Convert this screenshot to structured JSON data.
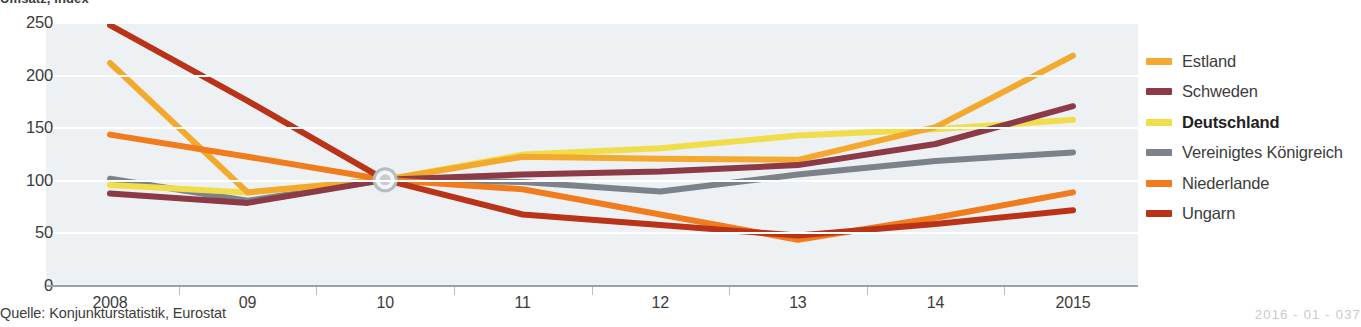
{
  "title": "Umsatz, Index",
  "source_note": "Quelle: Konjunkturstatistik, Eurostat",
  "doc_code": "2016 - 01 - 037",
  "legend": {
    "items": [
      {
        "label": "Estland",
        "color": "#f3a92e",
        "bold": false
      },
      {
        "label": "Schweden",
        "color": "#8c3a46",
        "bold": false
      },
      {
        "label": "Deutschland",
        "color": "#f0dd4a",
        "bold": true
      },
      {
        "label": "Vereinigtes Königreich",
        "color": "#7b8289",
        "bold": false
      },
      {
        "label": "Niederlande",
        "color": "#f07c1e",
        "bold": false
      },
      {
        "label": "Ungarn",
        "color": "#b93318",
        "bold": false
      }
    ]
  },
  "axes": {
    "y_ticks": [
      "0",
      "50",
      "100",
      "150",
      "200",
      "250"
    ],
    "x_ticks": [
      "2008",
      "09",
      "10",
      "11",
      "12",
      "13",
      "14",
      "2015"
    ]
  },
  "marker": {
    "x_category": "10",
    "value": 100
  },
  "chart_data": {
    "type": "line",
    "title": "Umsatz, Index",
    "xlabel": "",
    "ylabel": "",
    "ylim": [
      0,
      250
    ],
    "grid": true,
    "legend_position": "right",
    "categories": [
      "2008",
      "09",
      "10",
      "11",
      "12",
      "13",
      "14",
      "2015"
    ],
    "series": [
      {
        "name": "Estland",
        "color": "#f3a92e",
        "values": [
          211,
          88,
          100,
          122,
          120,
          119,
          150,
          218
        ]
      },
      {
        "name": "Schweden",
        "color": "#8c3a46",
        "values": [
          87,
          78,
          100,
          105,
          108,
          114,
          134,
          170
        ]
      },
      {
        "name": "Deutschland",
        "color": "#f0dd4a",
        "values": [
          95,
          88,
          100,
          124,
          130,
          142,
          148,
          157
        ]
      },
      {
        "name": "Vereinigtes Königreich",
        "color": "#7b8289",
        "values": [
          101,
          80,
          100,
          98,
          89,
          105,
          118,
          126
        ]
      },
      {
        "name": "Niederlande",
        "color": "#f07c1e",
        "values": [
          143,
          122,
          100,
          91,
          67,
          43,
          64,
          88
        ]
      },
      {
        "name": "Ungarn",
        "color": "#b93318",
        "values": [
          247,
          175,
          100,
          67,
          57,
          47,
          58,
          71
        ]
      }
    ]
  }
}
